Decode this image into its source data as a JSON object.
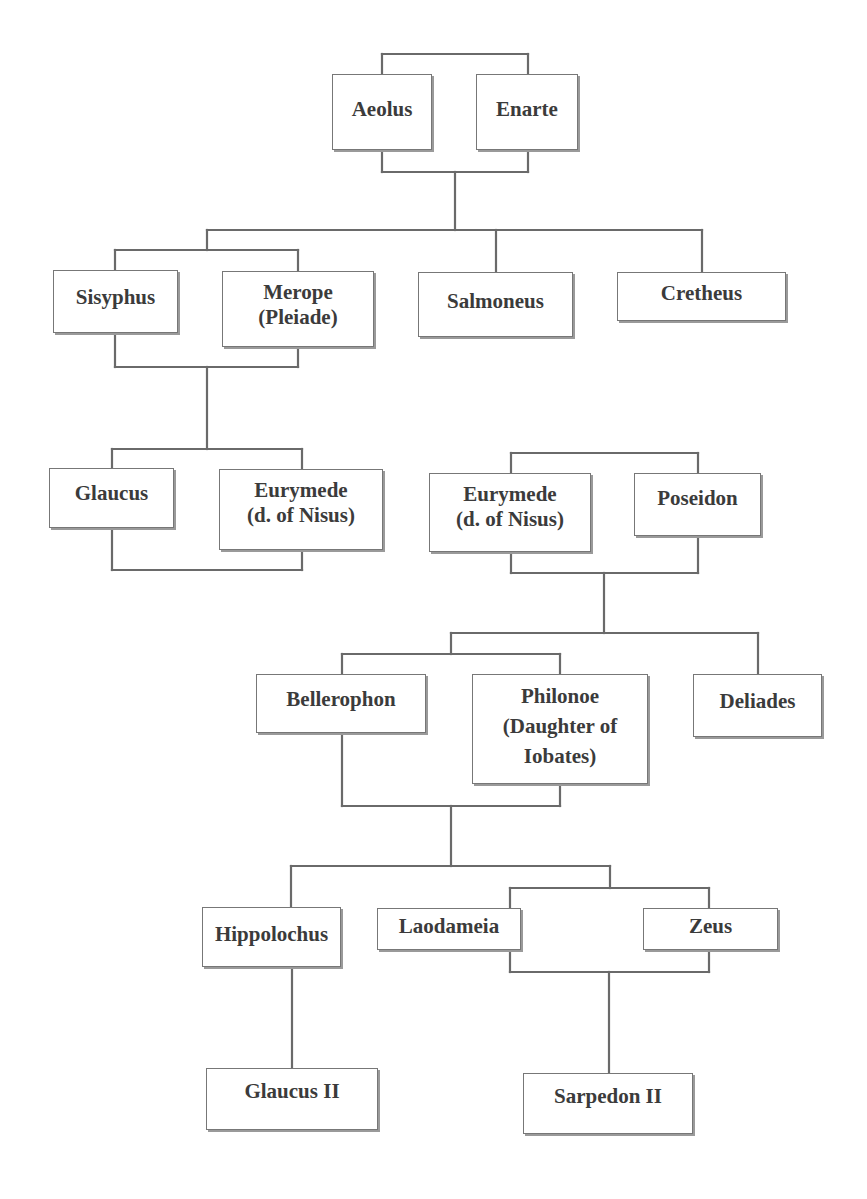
{
  "diagram": {
    "type": "family-tree",
    "line_color": "#6a6a6a",
    "box_border_color": "#777777",
    "text_color": "#3b3b3b",
    "nodes": {
      "aeolus": {
        "label": "Aeolus"
      },
      "enarte": {
        "label": "Enarte"
      },
      "sisyphus": {
        "label": "Sisyphus"
      },
      "merope": {
        "label": "Merope\n(Pleiade)"
      },
      "salmoneus": {
        "label": "Salmoneus"
      },
      "cretheus": {
        "label": "Cretheus"
      },
      "glaucus": {
        "label": "Glaucus"
      },
      "eurymede_1": {
        "label": "Eurymede\n(d. of Nisus)"
      },
      "eurymede_2": {
        "label": "Eurymede\n(d. of Nisus)"
      },
      "poseidon": {
        "label": "Poseidon"
      },
      "bellerophon": {
        "label": "Bellerophon"
      },
      "philonoe": {
        "label": "Philonoe\n(Daughter of\nIobates)"
      },
      "deliades": {
        "label": "Deliades"
      },
      "hippolochus": {
        "label": "Hippolochus"
      },
      "laodameia": {
        "label": "Laodameia"
      },
      "zeus": {
        "label": "Zeus"
      },
      "glaucus_ii": {
        "label": "Glaucus II"
      },
      "sarpedon_ii": {
        "label": "Sarpedon II"
      }
    },
    "unions": [
      {
        "partners": [
          "Aeolus",
          "Enarte"
        ],
        "children": [
          "Sisyphus",
          "Salmoneus",
          "Cretheus"
        ]
      },
      {
        "partners": [
          "Sisyphus",
          "Merope (Pleiade)"
        ],
        "children": [
          "Glaucus"
        ]
      },
      {
        "partners": [
          "Glaucus",
          "Eurymede (d. of Nisus)"
        ],
        "children": []
      },
      {
        "partners": [
          "Eurymede (d. of Nisus)",
          "Poseidon"
        ],
        "children": [
          "Bellerophon",
          "Deliades"
        ]
      },
      {
        "partners": [
          "Bellerophon",
          "Philonoe (Daughter of Iobates)"
        ],
        "children": [
          "Hippolochus",
          "Laodameia"
        ]
      },
      {
        "partners": [
          "Laodameia",
          "Zeus"
        ],
        "children": [
          "Sarpedon II"
        ]
      },
      {
        "partners": [
          "Hippolochus"
        ],
        "children": [
          "Glaucus II"
        ]
      }
    ]
  }
}
